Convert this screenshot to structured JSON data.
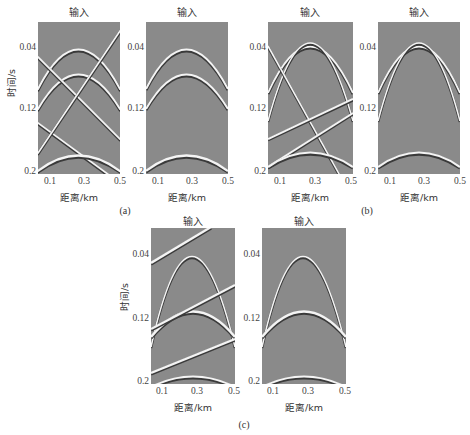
{
  "figure": {
    "subfigures": [
      {
        "id": "a",
        "caption": "(a)",
        "panels": [
          {
            "title": "输入",
            "events": "two hyperbolic reflections, one flat-ish hyperbola near 0.17s, plus crossing linear noise events"
          },
          {
            "title": "输入",
            "events": "two hyperbolic reflections and bottom hyperbola; linear noise removed"
          }
        ]
      },
      {
        "id": "b",
        "caption": "(b)",
        "panels": [
          {
            "title": "输入",
            "events": "hyperbolic reflections with crossing steep and gentle linear events"
          },
          {
            "title": "输入",
            "events": "hyperbolic reflections only; linear events removed"
          }
        ]
      },
      {
        "id": "c",
        "caption": "(c)",
        "panels": [
          {
            "title": "输入",
            "events": "diffraction apex, two hyperbolas and three parallel dipping linear events"
          },
          {
            "title": "输入",
            "events": "diffraction apex and hyperbolas only"
          }
        ]
      }
    ],
    "y_axis": {
      "label": "时间/s",
      "ticks": [
        "0.04",
        "0.12",
        "0.2"
      ]
    },
    "x_axis": {
      "label": "距离/km",
      "ticks": [
        "0.1",
        "0.3",
        "0.5"
      ]
    }
  },
  "colors": {
    "background": "#8a8a8a",
    "wave_bright": "#f4f4f4",
    "wave_dark": "#3a3a3a"
  }
}
